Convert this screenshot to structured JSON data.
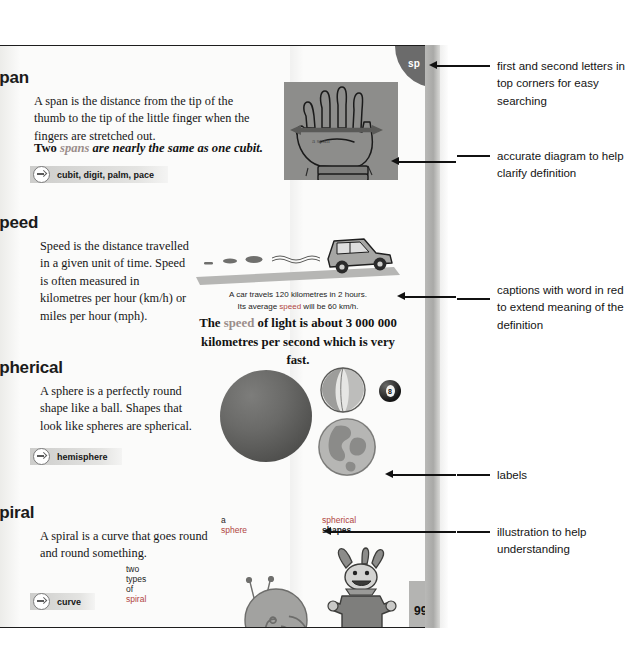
{
  "page": {
    "corner_tab_letters": "sp",
    "page_number": "99"
  },
  "entries": [
    {
      "headword": "span",
      "definition": "A span is the distance from the tip of the thumb to the tip of the little finger when the fingers are stretched out.",
      "bold_line_pre": "Two ",
      "bold_line_red": "spans",
      "bold_line_post": " are nearly the same as one cubit.",
      "xref": "cubit, digit, palm, pace",
      "figure_label": "a span"
    },
    {
      "headword": "speed",
      "definition": "Speed is the distance travelled in a given unit of time. Speed is often measured in kilometres per hour (km/h) or miles per hour (mph).",
      "caption_line1_pre": "A car travels 120 kilometres in 2 hours.",
      "caption_line2_pre": "Its average ",
      "caption_line2_red": "speed",
      "caption_line2_post": " will be 60 km/h.",
      "bold_line_pre": "The ",
      "bold_line_red": "speed",
      "bold_line_post": " of light is about 3 000 000 kilometres per second which is very fast."
    },
    {
      "headword": "spherical",
      "definition": "A sphere is a perfectly round shape like a ball. Shapes that look like spheres are spherical.",
      "xref": "hemisphere",
      "label_sphere_pre": "a ",
      "label_sphere_red": "sphere",
      "label_shapes_pre": "spherical ",
      "label_shapes_dark": "shapes",
      "eightball_number": "8"
    },
    {
      "headword": "spiral",
      "definition": "A spiral is a curve that goes round and round something.",
      "label_pre": "two types of ",
      "label_red": "spiral",
      "xref": "curve"
    }
  ],
  "annotations": [
    {
      "id": "corner-letters",
      "text": "first and second letters in top corners for easy searching"
    },
    {
      "id": "diagram",
      "text": "accurate diagram to help clarify definition"
    },
    {
      "id": "captions",
      "text": "captions with word in red to extend meaning of the definition"
    },
    {
      "id": "labels",
      "text": "labels"
    },
    {
      "id": "illustration",
      "text": "illustration to help understanding"
    }
  ],
  "colors": {
    "red_word": "#b0453f",
    "tab_bg": "#6b6b6b",
    "page_num_bg": "#b4b4b2",
    "ink": "#141414"
  }
}
